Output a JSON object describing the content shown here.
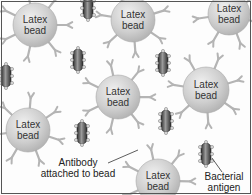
{
  "diagram": {
    "type": "latex agglutination illustration",
    "colors": {
      "bead_fill": "#c8c8c8",
      "bead_highlight": "#ececec",
      "antibody": "#b4b4b4",
      "bacterium_body": "#4a4a4a",
      "bacterium_highlight": "#9a9a9a",
      "antigen": "#d8d8d8",
      "text": "#222222",
      "border": "#555555"
    },
    "beads": [
      {
        "id": "bead-1",
        "cx": 35,
        "cy": 25,
        "r": 22,
        "line1": "Latex",
        "line2": "bead"
      },
      {
        "id": "bead-2",
        "cx": 133,
        "cy": 20,
        "r": 22,
        "line1": "Latex",
        "line2": "bead"
      },
      {
        "id": "bead-3",
        "cx": 229,
        "cy": 14,
        "r": 21,
        "line1": "Latex",
        "line2": "bead"
      },
      {
        "id": "bead-4",
        "cx": 118,
        "cy": 97,
        "r": 22,
        "line1": "Latex",
        "line2": "bead"
      },
      {
        "id": "bead-5",
        "cx": 206,
        "cy": 90,
        "r": 23,
        "line1": "Latex",
        "line2": "bead"
      },
      {
        "id": "bead-6",
        "cx": 28,
        "cy": 130,
        "r": 22,
        "line1": "Latex",
        "line2": "bead"
      },
      {
        "id": "bead-7",
        "cx": 158,
        "cy": 181,
        "r": 22,
        "line1": "Latex",
        "line2": "bead"
      }
    ],
    "bacteria": [
      {
        "cx": 88,
        "cy": 8,
        "angle": 0
      },
      {
        "cx": 78,
        "cy": 60,
        "angle": 0
      },
      {
        "cx": 6,
        "cy": 76,
        "angle": 0
      },
      {
        "cx": 163,
        "cy": 63,
        "angle": 0
      },
      {
        "cx": 166,
        "cy": 121,
        "angle": 0
      },
      {
        "cx": 82,
        "cy": 133,
        "angle": 0
      },
      {
        "cx": 206,
        "cy": 154,
        "angle": 0
      }
    ],
    "labels": {
      "antibody_line1": "Antibody",
      "antibody_line2": "attached to bead",
      "antigen_line1": "Bacterial",
      "antigen_line2": "antigen"
    }
  }
}
